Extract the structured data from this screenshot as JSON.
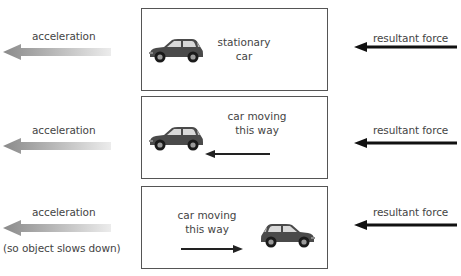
{
  "colors": {
    "acceleration_arrow_dark": "#8a8a8a",
    "acceleration_arrow_light": "#e6e6e6",
    "force_arrow": "#111111",
    "box_border": "#555555",
    "car_body": "#4a4a4a",
    "text": "#444444"
  },
  "rows": [
    {
      "acceleration_label": "acceleration",
      "note": "",
      "box_text_line1": "stationary",
      "box_text_line2": "car",
      "motion_arrow": "none",
      "force_label": "resultant force"
    },
    {
      "acceleration_label": "acceleration",
      "note": "",
      "box_text_line1": "car moving",
      "box_text_line2": "this way",
      "motion_arrow": "left",
      "force_label": "resultant force"
    },
    {
      "acceleration_label": "acceleration",
      "note": "(so object slows down)",
      "box_text_line1": "car moving",
      "box_text_line2": "this way",
      "motion_arrow": "right",
      "force_label": "resultant force"
    }
  ],
  "icons": {
    "acceleration_arrow": "gradient-left-arrow-icon",
    "force_arrow": "black-left-arrow-icon",
    "car": "car-icon"
  }
}
